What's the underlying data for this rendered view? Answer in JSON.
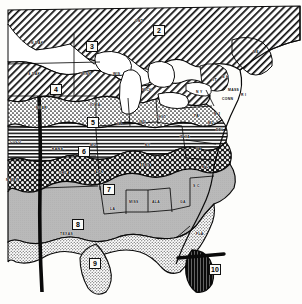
{
  "map": {
    "title": "Plant Hardiness Zone Map",
    "region": "Central and Eastern United States",
    "background_color": "#fdfdfb",
    "ink_color": "#000000",
    "zones": [
      {
        "id": "2",
        "label": "2",
        "x": 153,
        "y": 25,
        "pattern": "diagonal-hatch",
        "description": "Canada / northern border"
      },
      {
        "id": "3",
        "label": "3",
        "x": 86,
        "y": 41,
        "pattern": "white",
        "description": "northern Minnesota"
      },
      {
        "id": "4",
        "label": "4",
        "x": 50,
        "y": 84,
        "pattern": "diagonal-hatch",
        "description": "Dakotas / Wisconsin"
      },
      {
        "id": "5",
        "label": "5",
        "x": 87,
        "y": 117,
        "pattern": "stipple",
        "description": "Nebraska / Iowa / Michigan"
      },
      {
        "id": "6",
        "label": "6",
        "x": 78,
        "y": 146,
        "pattern": "horizontal-line",
        "description": "Kansas / Missouri / Ohio Valley"
      },
      {
        "id": "7",
        "label": "7",
        "x": 103,
        "y": 184,
        "pattern": "cross-hatch",
        "description": "Oklahoma / Arkansas / Tennessee"
      },
      {
        "id": "8",
        "label": "8",
        "x": 72,
        "y": 219,
        "pattern": "flat-gray",
        "description": "Texas / Gulf States / Carolinas"
      },
      {
        "id": "9",
        "label": "9",
        "x": 89,
        "y": 258,
        "pattern": "fine-stipple",
        "description": "South Texas / Gulf Coast / Florida"
      },
      {
        "id": "10",
        "label": "10",
        "x": 209,
        "y": 264,
        "pattern": "solid-black",
        "description": "South Florida"
      }
    ],
    "state_labels": [
      {
        "text": "N DAK",
        "x": 31,
        "y": 41
      },
      {
        "text": "S DAK",
        "x": 28,
        "y": 72
      },
      {
        "text": "MINN",
        "x": 81,
        "y": 72
      },
      {
        "text": "WIS",
        "x": 113,
        "y": 72
      },
      {
        "text": "MICH",
        "x": 142,
        "y": 88
      },
      {
        "text": "NEBR",
        "x": 36,
        "y": 106
      },
      {
        "text": "IOWA",
        "x": 90,
        "y": 103
      },
      {
        "text": "ILL",
        "x": 117,
        "y": 122
      },
      {
        "text": "IND",
        "x": 139,
        "y": 120
      },
      {
        "text": "OHIO",
        "x": 156,
        "y": 115
      },
      {
        "text": "KANS",
        "x": 52,
        "y": 147
      },
      {
        "text": "MO",
        "x": 90,
        "y": 143
      },
      {
        "text": "KY",
        "x": 145,
        "y": 143
      },
      {
        "text": "COLO",
        "x": 10,
        "y": 140
      },
      {
        "text": "OKLA",
        "x": 59,
        "y": 171
      },
      {
        "text": "ARK",
        "x": 95,
        "y": 170
      },
      {
        "text": "TENN",
        "x": 140,
        "y": 163
      },
      {
        "text": "N MEX",
        "x": 6,
        "y": 178
      },
      {
        "text": "TEXAS",
        "x": 60,
        "y": 232
      },
      {
        "text": "LA",
        "x": 110,
        "y": 207
      },
      {
        "text": "MISS",
        "x": 129,
        "y": 200
      },
      {
        "text": "ALA",
        "x": 152,
        "y": 200
      },
      {
        "text": "GA",
        "x": 180,
        "y": 200
      },
      {
        "text": "S C",
        "x": 193,
        "y": 184
      },
      {
        "text": "N C",
        "x": 202,
        "y": 165
      },
      {
        "text": "VA",
        "x": 196,
        "y": 147
      },
      {
        "text": "W VA",
        "x": 180,
        "y": 135
      },
      {
        "text": "PA",
        "x": 194,
        "y": 114
      },
      {
        "text": "N Y",
        "x": 196,
        "y": 90
      },
      {
        "text": "DEL",
        "x": 216,
        "y": 128
      },
      {
        "text": "MD",
        "x": 208,
        "y": 121
      },
      {
        "text": "N J",
        "x": 214,
        "y": 112
      },
      {
        "text": "CONN",
        "x": 222,
        "y": 97
      },
      {
        "text": "R I",
        "x": 241,
        "y": 93
      },
      {
        "text": "MASS",
        "x": 228,
        "y": 88
      },
      {
        "text": "VT",
        "x": 212,
        "y": 78
      },
      {
        "text": "N H",
        "x": 222,
        "y": 75
      },
      {
        "text": "ME",
        "x": 253,
        "y": 50
      },
      {
        "text": "ONT",
        "x": 135,
        "y": 19
      },
      {
        "text": "FLA",
        "x": 196,
        "y": 232
      }
    ]
  }
}
